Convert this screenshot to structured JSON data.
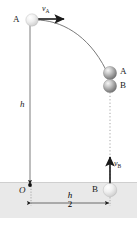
{
  "figure": {
    "background_color": "#ffffff",
    "ground_color": "#e8e8e8",
    "line_color": "#4a4a4a",
    "ball_color": "#9a9a9a",
    "ball_light_color": "#f2f2f2"
  },
  "labels": {
    "ball_a_start": "A",
    "velocity_a": "v",
    "velocity_a_sub": "A",
    "height_h": "h",
    "ball_a_collision": "A",
    "ball_b_collision": "B",
    "velocity_b": "v",
    "velocity_b_sub": "B",
    "ball_b_start": "B",
    "origin": "O",
    "distance_numerator": "h",
    "distance_denominator": "2"
  },
  "physics": {
    "launch_height": "h",
    "horizontal_separation": "h/2",
    "ball_a_motion": "horizontal projectile from height h with initial velocity v_A",
    "ball_b_motion": "vertical launch upward from ground with initial velocity v_B",
    "collision_point": "balls A and B meet in mid-air"
  }
}
